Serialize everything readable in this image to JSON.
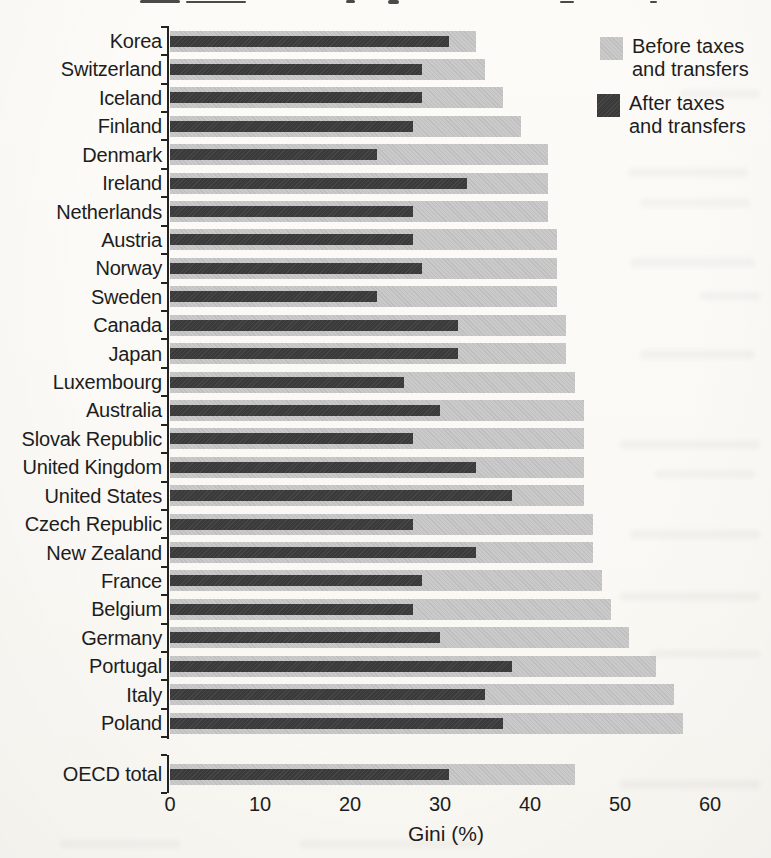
{
  "chart_data": {
    "type": "bar",
    "orientation": "horizontal",
    "title": "",
    "xlabel": "Gini (%)",
    "xlim": [
      0,
      60
    ],
    "x_ticks": [
      0,
      10,
      20,
      30,
      40,
      50,
      60
    ],
    "grid": false,
    "legend_position": "top-right",
    "separated_last_category": true,
    "categories": [
      "Korea",
      "Switzerland",
      "Iceland",
      "Finland",
      "Denmark",
      "Ireland",
      "Netherlands",
      "Austria",
      "Norway",
      "Sweden",
      "Canada",
      "Japan",
      "Luxembourg",
      "Australia",
      "Slovak Republic",
      "United Kingdom",
      "United States",
      "Czech Republic",
      "New Zealand",
      "France",
      "Belgium",
      "Germany",
      "Portugal",
      "Italy",
      "Poland",
      "OECD total"
    ],
    "series": [
      {
        "name": "Before taxes and transfers",
        "color": "#c8c8c8",
        "values": [
          34,
          35,
          37,
          39,
          42,
          42,
          42,
          43,
          43,
          43,
          44,
          44,
          45,
          46,
          46,
          46,
          46,
          47,
          47,
          48,
          49,
          51,
          54,
          56,
          57,
          45
        ]
      },
      {
        "name": "After taxes and transfers",
        "color": "#3d3d3d",
        "values": [
          31,
          28,
          28,
          27,
          23,
          33,
          27,
          27,
          28,
          23,
          32,
          32,
          26,
          30,
          27,
          34,
          38,
          27,
          34,
          28,
          27,
          30,
          38,
          35,
          37,
          31
        ]
      }
    ]
  },
  "colors": {
    "paper": "#fbf9f6",
    "text": "#1c1c1c",
    "axis": "#1c1c1c",
    "bar_before": "#c8c8c8",
    "bar_after": "#3d3d3d"
  }
}
